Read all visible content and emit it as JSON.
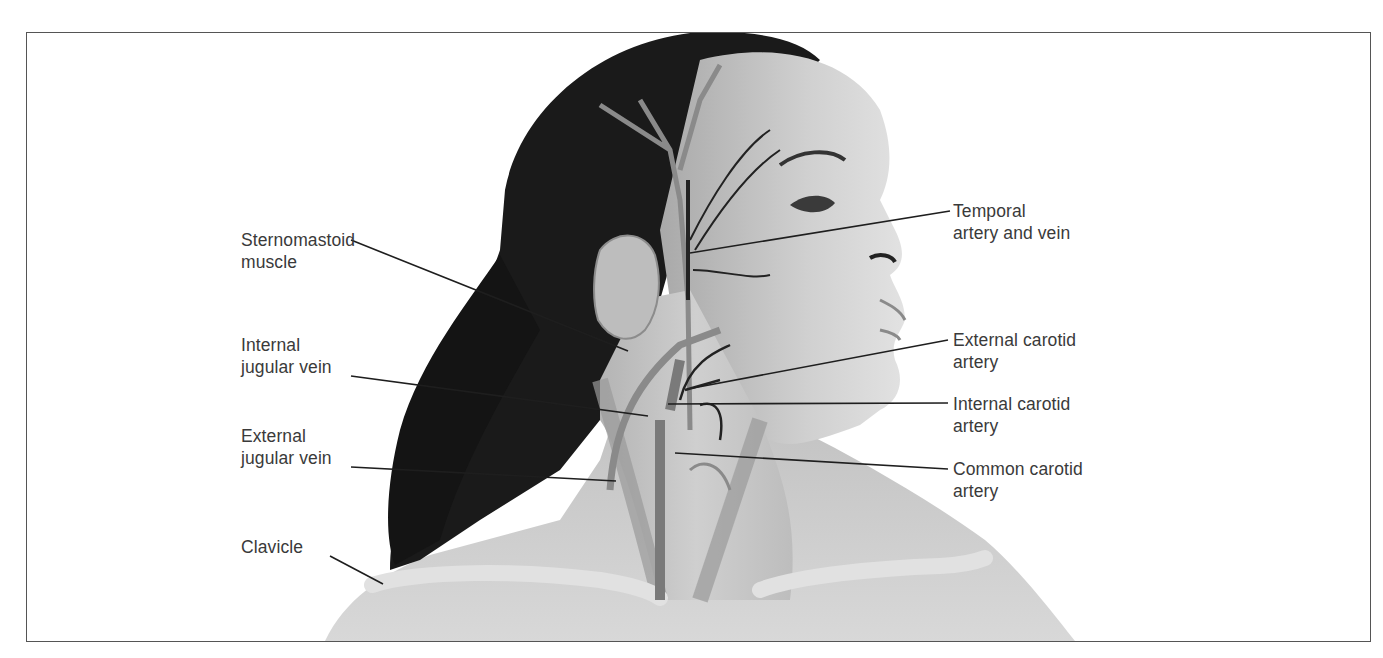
{
  "figure": {
    "colors": {
      "frame": "#555555",
      "label_text": "#3a3a3a",
      "leader_line": "#1e1e1e",
      "hair": "#1a1a1a",
      "skin": "#c9c9c9",
      "vessel": "#8a8a8a",
      "vessel_dark": "#222222",
      "bone": "#dcdcdc"
    }
  },
  "labels": {
    "left": [
      {
        "id": "sternomastoid",
        "lines": [
          "Sternomastoid",
          "muscle"
        ],
        "x": 241,
        "y": 229,
        "line": [
          351,
          240,
          628,
          351
        ]
      },
      {
        "id": "internal-jugular",
        "lines": [
          "Internal",
          "jugular vein"
        ],
        "x": 241,
        "y": 336,
        "line": [
          351,
          376,
          648,
          416
        ]
      },
      {
        "id": "external-jugular",
        "lines": [
          "External",
          "jugular vein"
        ],
        "x": 241,
        "y": 428,
        "line": [
          351,
          467,
          616,
          481
        ]
      },
      {
        "id": "clavicle",
        "lines": [
          "Clavicle"
        ],
        "x": 241,
        "y": 537,
        "line": [
          330,
          556,
          383,
          584
        ]
      }
    ],
    "right": [
      {
        "id": "temporal",
        "lines": [
          "Temporal",
          "artery and vein"
        ],
        "x": 953,
        "y": 200,
        "line": [
          950,
          211,
          690,
          253
        ]
      },
      {
        "id": "external-carotid",
        "lines": [
          "External carotid",
          "artery"
        ],
        "x": 953,
        "y": 330,
        "line": [
          948,
          340,
          693,
          388
        ]
      },
      {
        "id": "internal-carotid",
        "lines": [
          "Internal carotid",
          "artery"
        ],
        "x": 953,
        "y": 396,
        "line": [
          948,
          403,
          668,
          404
        ]
      },
      {
        "id": "common-carotid",
        "lines": [
          "Common carotid",
          "artery"
        ],
        "x": 953,
        "y": 460,
        "line": [
          948,
          469,
          675,
          453
        ]
      }
    ]
  },
  "text": {
    "sternomastoid_1": "Sternomastoid",
    "sternomastoid_2": "muscle",
    "internal_jugular_1": "Internal",
    "internal_jugular_2": "jugular vein",
    "external_jugular_1": "External",
    "external_jugular_2": "jugular vein",
    "clavicle_1": "Clavicle",
    "temporal_1": "Temporal",
    "temporal_2": "artery and vein",
    "external_carotid_1": "External carotid",
    "external_carotid_2": "artery",
    "internal_carotid_1": "Internal carotid",
    "internal_carotid_2": "artery",
    "common_carotid_1": "Common carotid",
    "common_carotid_2": "artery"
  }
}
